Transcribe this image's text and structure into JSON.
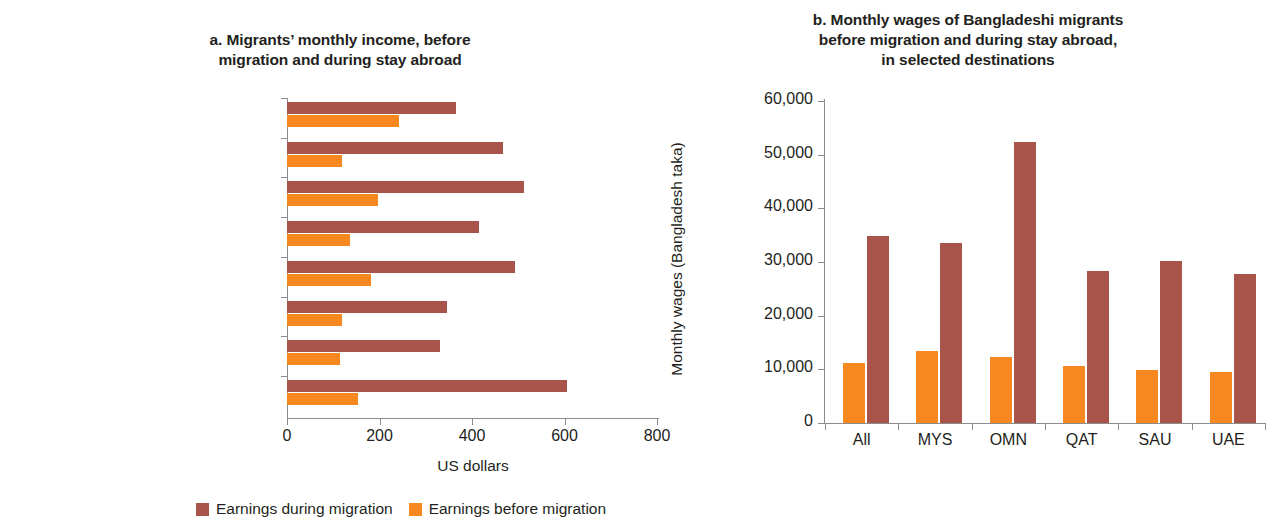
{
  "legend": {
    "during_label": "Earnings during migration",
    "before_label": "Earnings before migration",
    "during_color": "#a8544a",
    "before_color": "#f7871f"
  },
  "panel_a": {
    "title": "a. Migrants’ monthly income, before migration and during stay abroad",
    "title_line1": "a. Migrants’ monthly income, before",
    "title_line2": "migration and during stay abroad",
    "xlabel": "US dollars",
    "xticks": [
      "0",
      "200",
      "400",
      "600",
      "800"
    ],
    "categories": [
      "Vietnam–Malaysia",
      "Philippines–Saudi Arabia",
      "Philippines–Qatar",
      "Pakistan–United Arab Emirates",
      "Pakistan–Saudi Arabia",
      "Nepal–Qatar",
      "India–Saudi Arabia",
      "India–Qatar"
    ]
  },
  "panel_b": {
    "title": "b. Monthly wages of Bangladeshi migrants before migration and during stay abroad, in selected destinations",
    "title_line1": "b. Monthly wages of Bangladeshi migrants",
    "title_line2": "before migration and during stay abroad,",
    "title_line3": "in selected destinations",
    "ylabel": "Monthly wages (Bangladesh taka)",
    "yticks": [
      "0",
      "10,000",
      "20,000",
      "30,000",
      "40,000",
      "50,000",
      "60,000"
    ],
    "categories": [
      "All",
      "MYS",
      "OMN",
      "QAT",
      "SAU",
      "UAE"
    ]
  },
  "chart_data": [
    {
      "type": "bar",
      "orientation": "horizontal",
      "panel": "a",
      "title": "a. Migrants’ monthly income, before migration and during stay abroad",
      "xlabel": "US dollars",
      "ylabel": "",
      "xlim": [
        0,
        800
      ],
      "xticks": [
        0,
        200,
        400,
        600,
        800
      ],
      "grid": false,
      "legend_position": "bottom",
      "categories": [
        "Vietnam–Malaysia",
        "Philippines–Saudi Arabia",
        "Philippines–Qatar",
        "Pakistan–United Arab Emirates",
        "Pakistan–Saudi Arabia",
        "Nepal–Qatar",
        "India–Saudi Arabia",
        "India–Qatar"
      ],
      "series": [
        {
          "name": "Earnings during migration",
          "color": "#a8544a",
          "values": [
            365,
            468,
            512,
            415,
            492,
            345,
            330,
            605
          ]
        },
        {
          "name": "Earnings before migration",
          "color": "#f7871f",
          "values": [
            243,
            118,
            196,
            136,
            181,
            119,
            114,
            153
          ]
        }
      ]
    },
    {
      "type": "bar",
      "orientation": "vertical",
      "panel": "b",
      "title": "b. Monthly wages of Bangladeshi migrants before migration and during stay abroad, in selected destinations",
      "xlabel": "",
      "ylabel": "Monthly wages (Bangladesh taka)",
      "ylim": [
        0,
        60000
      ],
      "yticks": [
        0,
        10000,
        20000,
        30000,
        40000,
        50000,
        60000
      ],
      "grid": false,
      "legend_position": "bottom",
      "categories": [
        "All",
        "MYS",
        "OMN",
        "QAT",
        "SAU",
        "UAE"
      ],
      "series": [
        {
          "name": "Earnings before migration",
          "color": "#f7871f",
          "values": [
            11200,
            13400,
            12300,
            10600,
            9900,
            9500
          ]
        },
        {
          "name": "Earnings during migration",
          "color": "#a8544a",
          "values": [
            34900,
            33500,
            52300,
            28400,
            30100,
            27700
          ]
        }
      ]
    }
  ]
}
